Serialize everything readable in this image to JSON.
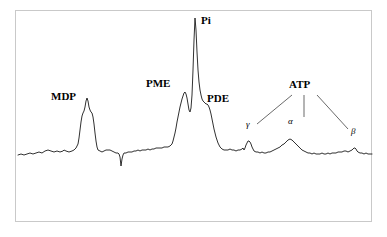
{
  "figure": {
    "title": "",
    "width": 387,
    "height": 237,
    "background_color": "#ffffff",
    "frame_color": "#c9c9c9",
    "trace_color": "#1a1a1a",
    "leader_line_color": "#2a2a2a"
  },
  "labels": {
    "mdp": "MDP",
    "pme": "PME",
    "pi": "Pi",
    "pde": "PDE",
    "atp": "ATP",
    "gamma": "γ",
    "alpha": "α",
    "beta": "β"
  },
  "chart_data": {
    "type": "line",
    "title": "",
    "xlabel": "",
    "ylabel": "",
    "grid": false,
    "legend": "none",
    "axis_visible": false,
    "xlim": [
      18,
      372
    ],
    "ylim": [
      18,
      168
    ],
    "baseline_y": 155,
    "peaks": [
      {
        "name": "MDP",
        "label": "MDP",
        "x": 87,
        "apex_y": 98,
        "height": 57
      },
      {
        "name": "PME",
        "label": "PME",
        "x": 185,
        "apex_y": 92,
        "height": 63
      },
      {
        "name": "Pi",
        "label": "Pi",
        "x": 195,
        "apex_y": 18,
        "height": 137
      },
      {
        "name": "PDE",
        "label": "PDE",
        "x": 208,
        "apex_y": 105,
        "height": 50
      },
      {
        "name": "ATP-gamma",
        "label": "γ",
        "x": 249,
        "apex_y": 141,
        "height": 14
      },
      {
        "name": "ATP-alpha",
        "label": "α",
        "x": 290,
        "apex_y": 139,
        "height": 16
      },
      {
        "name": "ATP-beta",
        "label": "β",
        "x": 355,
        "apex_y": 148,
        "height": 7
      }
    ],
    "artifacts": [
      {
        "name": "negative-spike",
        "x": 121,
        "y": 166,
        "direction": "down"
      }
    ],
    "series": [
      {
        "name": "spectrum",
        "points": [
          [
            18,
            155
          ],
          [
            21,
            154
          ],
          [
            24,
            155
          ],
          [
            27,
            154
          ],
          [
            30,
            153
          ],
          [
            33,
            154
          ],
          [
            36,
            153
          ],
          [
            39,
            152
          ],
          [
            42,
            153
          ],
          [
            45,
            151
          ],
          [
            48,
            150
          ],
          [
            51,
            151
          ],
          [
            54,
            152
          ],
          [
            57,
            151
          ],
          [
            60,
            152
          ],
          [
            63,
            151
          ],
          [
            64,
            150
          ],
          [
            66,
            151
          ],
          [
            69,
            152
          ],
          [
            72,
            151
          ],
          [
            74,
            150
          ],
          [
            76,
            148
          ],
          [
            78,
            144
          ],
          [
            79,
            138
          ],
          [
            80,
            130
          ],
          [
            81,
            122
          ],
          [
            82,
            116
          ],
          [
            83,
            113
          ],
          [
            84,
            111
          ],
          [
            85,
            107
          ],
          [
            86,
            101
          ],
          [
            87,
            98
          ],
          [
            88,
            101
          ],
          [
            89,
            107
          ],
          [
            90,
            110
          ],
          [
            91,
            112
          ],
          [
            92,
            113
          ],
          [
            93,
            117
          ],
          [
            94,
            124
          ],
          [
            95,
            133
          ],
          [
            96,
            141
          ],
          [
            97,
            147
          ],
          [
            98,
            150
          ],
          [
            100,
            151
          ],
          [
            102,
            152
          ],
          [
            104,
            151
          ],
          [
            106,
            150
          ],
          [
            108,
            150
          ],
          [
            110,
            150
          ],
          [
            112,
            151
          ],
          [
            114,
            152
          ],
          [
            116,
            153
          ],
          [
            118,
            153
          ],
          [
            119,
            154
          ],
          [
            120,
            157
          ],
          [
            121,
            166
          ],
          [
            122,
            159
          ],
          [
            123,
            155
          ],
          [
            124,
            153
          ],
          [
            126,
            153
          ],
          [
            128,
            152
          ],
          [
            130,
            152
          ],
          [
            132,
            152
          ],
          [
            134,
            151
          ],
          [
            136,
            151
          ],
          [
            138,
            150
          ],
          [
            140,
            151
          ],
          [
            142,
            150
          ],
          [
            144,
            150
          ],
          [
            146,
            150
          ],
          [
            148,
            149
          ],
          [
            150,
            150
          ],
          [
            152,
            149
          ],
          [
            154,
            149
          ],
          [
            156,
            148
          ],
          [
            158,
            148
          ],
          [
            160,
            148
          ],
          [
            162,
            148
          ],
          [
            164,
            147
          ],
          [
            166,
            147
          ],
          [
            168,
            147
          ],
          [
            170,
            146
          ],
          [
            172,
            144
          ],
          [
            173,
            141
          ],
          [
            174,
            137
          ],
          [
            175,
            133
          ],
          [
            176,
            128
          ],
          [
            177,
            122
          ],
          [
            178,
            117
          ],
          [
            179,
            112
          ],
          [
            180,
            107
          ],
          [
            181,
            103
          ],
          [
            182,
            99
          ],
          [
            183,
            96
          ],
          [
            184,
            93
          ],
          [
            185,
            92
          ],
          [
            186,
            94
          ],
          [
            187,
            98
          ],
          [
            188,
            104
          ],
          [
            189,
            110
          ],
          [
            190,
            112
          ],
          [
            191,
            108
          ],
          [
            192,
            95
          ],
          [
            193,
            70
          ],
          [
            194,
            40
          ],
          [
            195,
            18
          ],
          [
            196,
            30
          ],
          [
            197,
            52
          ],
          [
            198,
            70
          ],
          [
            199,
            82
          ],
          [
            200,
            90
          ],
          [
            201,
            95
          ],
          [
            202,
            99
          ],
          [
            203,
            101
          ],
          [
            204,
            102
          ],
          [
            205,
            103
          ],
          [
            206,
            104
          ],
          [
            207,
            104
          ],
          [
            208,
            105
          ],
          [
            209,
            107
          ],
          [
            210,
            110
          ],
          [
            211,
            114
          ],
          [
            212,
            119
          ],
          [
            213,
            124
          ],
          [
            214,
            129
          ],
          [
            215,
            133
          ],
          [
            216,
            137
          ],
          [
            217,
            140
          ],
          [
            218,
            143
          ],
          [
            219,
            145
          ],
          [
            220,
            147
          ],
          [
            222,
            149
          ],
          [
            224,
            150
          ],
          [
            226,
            150
          ],
          [
            228,
            150
          ],
          [
            230,
            149
          ],
          [
            232,
            150
          ],
          [
            234,
            150
          ],
          [
            236,
            151
          ],
          [
            238,
            150
          ],
          [
            240,
            150
          ],
          [
            242,
            149
          ],
          [
            243,
            148
          ],
          [
            244,
            150
          ],
          [
            245,
            148
          ],
          [
            246,
            145
          ],
          [
            247,
            143
          ],
          [
            248,
            141
          ],
          [
            249,
            141
          ],
          [
            250,
            142
          ],
          [
            251,
            144
          ],
          [
            252,
            147
          ],
          [
            253,
            149
          ],
          [
            254,
            151
          ],
          [
            256,
            152
          ],
          [
            258,
            152
          ],
          [
            260,
            153
          ],
          [
            262,
            152
          ],
          [
            264,
            153
          ],
          [
            266,
            153
          ],
          [
            268,
            152
          ],
          [
            270,
            152
          ],
          [
            272,
            151
          ],
          [
            274,
            150
          ],
          [
            276,
            149
          ],
          [
            278,
            148
          ],
          [
            280,
            147
          ],
          [
            282,
            145
          ],
          [
            284,
            144
          ],
          [
            286,
            142
          ],
          [
            288,
            140
          ],
          [
            290,
            139
          ],
          [
            292,
            140
          ],
          [
            294,
            142
          ],
          [
            296,
            144
          ],
          [
            298,
            146
          ],
          [
            300,
            148
          ],
          [
            302,
            150
          ],
          [
            304,
            151
          ],
          [
            306,
            152
          ],
          [
            308,
            153
          ],
          [
            310,
            153
          ],
          [
            312,
            154
          ],
          [
            314,
            153
          ],
          [
            316,
            154
          ],
          [
            318,
            154
          ],
          [
            320,
            154
          ],
          [
            322,
            153
          ],
          [
            324,
            154
          ],
          [
            326,
            154
          ],
          [
            328,
            153
          ],
          [
            330,
            154
          ],
          [
            332,
            153
          ],
          [
            334,
            153
          ],
          [
            336,
            153
          ],
          [
            338,
            152
          ],
          [
            340,
            152
          ],
          [
            342,
            152
          ],
          [
            344,
            151
          ],
          [
            346,
            151
          ],
          [
            348,
            152
          ],
          [
            350,
            151
          ],
          [
            352,
            150
          ],
          [
            354,
            148
          ],
          [
            355,
            148
          ],
          [
            356,
            149
          ],
          [
            357,
            151
          ],
          [
            358,
            152
          ],
          [
            360,
            153
          ],
          [
            362,
            153
          ],
          [
            364,
            154
          ],
          [
            366,
            153
          ],
          [
            368,
            154
          ],
          [
            370,
            154
          ],
          [
            372,
            154
          ]
        ]
      }
    ],
    "annotations": [
      {
        "name": "atp-bracket",
        "text": "ATP",
        "leader_lines": [
          {
            "from": [
              292,
              95
            ],
            "to": [
              257,
              124
            ]
          },
          {
            "from": [
              304,
              95
            ],
            "to": [
              304,
              117
            ]
          },
          {
            "from": [
              317,
              95
            ],
            "to": [
              348,
              129
            ]
          }
        ]
      }
    ]
  }
}
